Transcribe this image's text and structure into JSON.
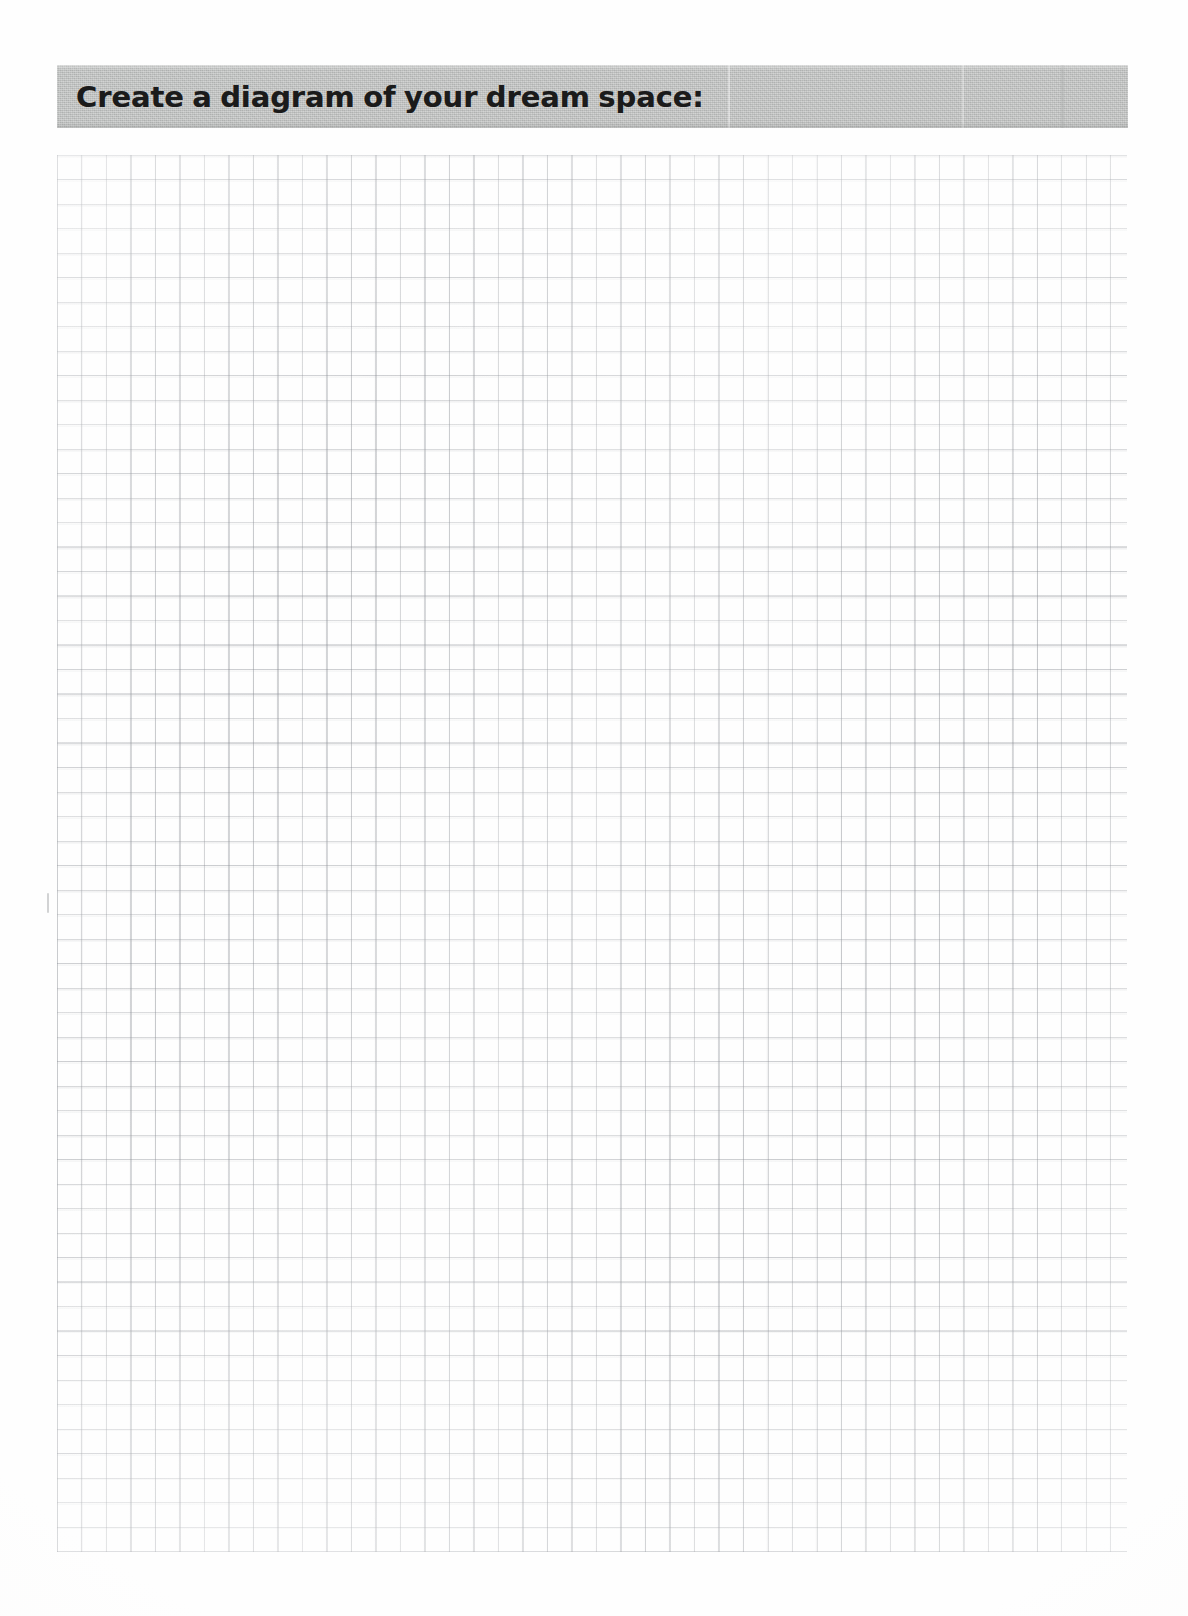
{
  "page": {
    "width": 1188,
    "height": 1616,
    "background_color": "#fefefe",
    "media": "scanned-paper-worksheet"
  },
  "header": {
    "title": "Create a diagram of your dream space:",
    "banner_color": "#babcbb",
    "text_color": "#1b1b1b"
  },
  "worksheet": {
    "response_area_label": "blank graph-paper response area",
    "grid": {
      "cell_size_px": 24.5,
      "line_color": "#81858c",
      "columns": 44,
      "rows": 57,
      "ruling": "square-grid"
    }
  },
  "artifacts": {
    "margin_tick_label": "scan-artifact-tick-mark"
  }
}
